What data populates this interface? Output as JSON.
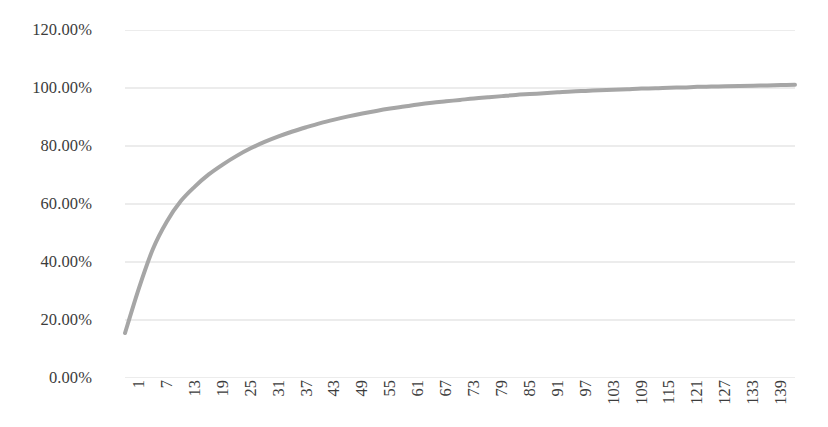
{
  "chart_data": {
    "type": "line",
    "title": "",
    "subtitle": "",
    "xlabel": "",
    "ylabel": "",
    "grid": true,
    "legend": "none",
    "line_color": "#a6a6a6",
    "line_width": 4,
    "background": "#ffffff",
    "gridline_color": "#d9d9d9",
    "text_color": "#3c3c3c",
    "ylim": [
      0,
      120
    ],
    "y_tick_values": [
      0,
      20,
      40,
      60,
      80,
      100,
      120
    ],
    "y_tick_labels": [
      "0.00%",
      "20.00%",
      "40.00%",
      "60.00%",
      "80.00%",
      "100.00%",
      "120.00%"
    ],
    "y_unit": "%",
    "xlim": [
      1,
      145
    ],
    "x_tick_labels": [
      "1",
      "7",
      "13",
      "19",
      "25",
      "31",
      "37",
      "43",
      "49",
      "55",
      "61",
      "67",
      "73",
      "79",
      "85",
      "91",
      "97",
      "103",
      "109",
      "115",
      "121",
      "127",
      "133",
      "139"
    ],
    "x_tick_values": [
      1,
      7,
      13,
      19,
      25,
      31,
      37,
      43,
      49,
      55,
      61,
      67,
      73,
      79,
      85,
      91,
      97,
      103,
      109,
      115,
      121,
      127,
      133,
      139
    ],
    "x": [
      1,
      4,
      7,
      10,
      13,
      16,
      19,
      22,
      25,
      28,
      31,
      34,
      37,
      40,
      43,
      46,
      49,
      52,
      55,
      58,
      61,
      64,
      67,
      70,
      73,
      76,
      79,
      82,
      85,
      88,
      91,
      94,
      97,
      100,
      103,
      106,
      109,
      112,
      115,
      118,
      121,
      124,
      127,
      130,
      133,
      136,
      139,
      142,
      145
    ],
    "values": [
      15.5,
      31.0,
      44.5,
      54.0,
      61.0,
      66.0,
      70.2,
      73.6,
      76.6,
      79.2,
      81.4,
      83.3,
      85.0,
      86.5,
      87.9,
      89.1,
      90.2,
      91.2,
      92.1,
      92.9,
      93.6,
      94.3,
      94.9,
      95.4,
      95.9,
      96.4,
      96.8,
      97.2,
      97.6,
      97.9,
      98.2,
      98.5,
      98.8,
      99.0,
      99.2,
      99.4,
      99.6,
      99.8,
      99.9,
      100.1,
      100.2,
      100.4,
      100.5,
      100.6,
      100.7,
      100.8,
      100.9,
      101.0,
      101.1
    ],
    "series": [
      {
        "name": "Cumulative percentage",
        "color": "#a6a6a6",
        "values": [
          15.5,
          31.0,
          44.5,
          54.0,
          61.0,
          66.0,
          70.2,
          73.6,
          76.6,
          79.2,
          81.4,
          83.3,
          85.0,
          86.5,
          87.9,
          89.1,
          90.2,
          91.2,
          92.1,
          92.9,
          93.6,
          94.3,
          94.9,
          95.4,
          95.9,
          96.4,
          96.8,
          97.2,
          97.6,
          97.9,
          98.2,
          98.5,
          98.8,
          99.0,
          99.2,
          99.4,
          99.6,
          99.8,
          99.9,
          100.1,
          100.2,
          100.4,
          100.5,
          100.6,
          100.7,
          100.8,
          100.9,
          101.0,
          101.1
        ]
      }
    ]
  }
}
